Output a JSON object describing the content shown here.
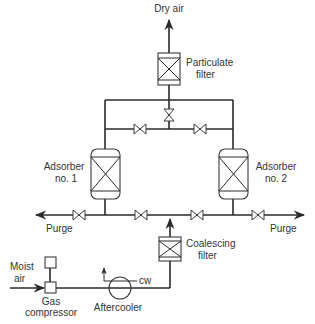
{
  "diagram": {
    "type": "process-flow-diagram",
    "colors": {
      "line": "#2a2a2a",
      "text": "#333333",
      "background": "#ffffff"
    },
    "labels": {
      "dry_air": "Dry air",
      "particulate_filter_line1": "Particulate",
      "particulate_filter_line2": "filter",
      "adsorber1_line1": "Adsorber",
      "adsorber1_line2": "no. 1",
      "adsorber2_line1": "Adsorber",
      "adsorber2_line2": "no. 2",
      "purge_left": "Purge",
      "purge_right": "Purge",
      "coalescing_filter_line1": "Coalescing",
      "coalescing_filter_line2": "filter",
      "moist_air_line1": "Moist",
      "moist_air_line2": "air",
      "cw": "cw",
      "gas_compressor_line1": "Gas",
      "gas_compressor_line2": "compressor",
      "aftercooler": "Aftercooler"
    },
    "components": [
      {
        "id": "particulate-filter",
        "kind": "filter"
      },
      {
        "id": "adsorber-1",
        "kind": "adsorber-vessel"
      },
      {
        "id": "adsorber-2",
        "kind": "adsorber-vessel"
      },
      {
        "id": "coalescing-filter",
        "kind": "filter"
      },
      {
        "id": "aftercooler",
        "kind": "heat-exchanger"
      },
      {
        "id": "gas-compressor",
        "kind": "compressor"
      },
      {
        "id": "valves",
        "count": 9
      }
    ],
    "flows": [
      {
        "from": "Moist air",
        "to": "Gas compressor"
      },
      {
        "from": "Gas compressor",
        "to": "Aftercooler"
      },
      {
        "from": "Aftercooler",
        "to": "Coalescing filter"
      },
      {
        "from": "Coalescing filter",
        "to": "Adsorbers"
      },
      {
        "from": "Adsorbers",
        "to": "Particulate filter"
      },
      {
        "from": "Particulate filter",
        "to": "Dry air"
      },
      {
        "from": "Adsorbers",
        "to": "Purge"
      }
    ]
  }
}
